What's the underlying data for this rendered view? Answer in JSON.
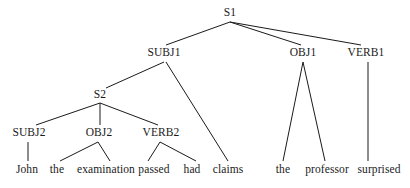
{
  "figure": {
    "type": "syntax-tree-diagram",
    "background_color": "#ffffff",
    "text_color": "#1a1a1a",
    "edge_color": "#1a1a1a",
    "width": 410,
    "height": 188,
    "sentence": "John the examination passed had claims the professor surprised"
  },
  "nodes": [
    {
      "id": "S1",
      "label": "S1",
      "x": 230,
      "y": 13,
      "level": 0
    },
    {
      "id": "SUBJ1",
      "label": "SUBJ1",
      "x": 164,
      "y": 53,
      "level": 1
    },
    {
      "id": "OBJ1",
      "label": "OBJ1",
      "x": 303,
      "y": 53,
      "level": 1
    },
    {
      "id": "VERB1",
      "label": "VERB1",
      "x": 366,
      "y": 53,
      "level": 1
    },
    {
      "id": "S2",
      "label": "S2",
      "x": 100,
      "y": 95,
      "level": 2
    },
    {
      "id": "SUBJ2",
      "label": "SUBJ2",
      "x": 29,
      "y": 133,
      "level": 3
    },
    {
      "id": "OBJ2",
      "label": "OBJ2",
      "x": 99,
      "y": 133,
      "level": 3
    },
    {
      "id": "VERB2",
      "label": "VERB2",
      "x": 161,
      "y": 133,
      "level": 3
    }
  ],
  "leaves": [
    {
      "id": "w1",
      "label": "John",
      "x": 27,
      "y": 170
    },
    {
      "id": "w2",
      "label": "the",
      "x": 57,
      "y": 170
    },
    {
      "id": "w3",
      "label": "examination",
      "x": 106,
      "y": 170
    },
    {
      "id": "w4",
      "label": "passed",
      "x": 154,
      "y": 170
    },
    {
      "id": "w5",
      "label": "had",
      "x": 192,
      "y": 170
    },
    {
      "id": "w6",
      "label": "claims",
      "x": 228,
      "y": 170
    },
    {
      "id": "w7",
      "label": "the",
      "x": 283,
      "y": 170
    },
    {
      "id": "w8",
      "label": "professor",
      "x": 327,
      "y": 170
    },
    {
      "id": "w9",
      "label": "surprised",
      "x": 379,
      "y": 170
    }
  ],
  "edges": [
    {
      "from": "S1",
      "to": "SUBJ1",
      "x1": 230,
      "y1": 22,
      "x2": 166,
      "y2": 45
    },
    {
      "from": "S1",
      "to": "OBJ1",
      "x1": 230,
      "y1": 22,
      "x2": 301,
      "y2": 45
    },
    {
      "from": "S1",
      "to": "VERB1",
      "x1": 230,
      "y1": 22,
      "x2": 361,
      "y2": 45
    },
    {
      "from": "SUBJ1",
      "to": "S2",
      "x1": 164,
      "y1": 62,
      "x2": 106,
      "y2": 88
    },
    {
      "from": "SUBJ1",
      "to": "w6",
      "x1": 166,
      "y1": 62,
      "x2": 228,
      "y2": 161
    },
    {
      "from": "S2",
      "to": "SUBJ2",
      "x1": 100,
      "y1": 103,
      "x2": 36,
      "y2": 125
    },
    {
      "from": "S2",
      "to": "OBJ2",
      "x1": 100,
      "y1": 103,
      "x2": 100,
      "y2": 125
    },
    {
      "from": "S2",
      "to": "VERB2",
      "x1": 100,
      "y1": 103,
      "x2": 158,
      "y2": 125
    },
    {
      "from": "SUBJ2",
      "to": "w1",
      "x1": 28,
      "y1": 142,
      "x2": 28,
      "y2": 161
    },
    {
      "from": "OBJ2",
      "to": "w2",
      "x1": 98,
      "y1": 142,
      "x2": 60,
      "y2": 161
    },
    {
      "from": "OBJ2",
      "to": "w3",
      "x1": 98,
      "y1": 142,
      "x2": 110,
      "y2": 161
    },
    {
      "from": "VERB2",
      "to": "w4",
      "x1": 160,
      "y1": 142,
      "x2": 148,
      "y2": 161
    },
    {
      "from": "VERB2",
      "to": "w5",
      "x1": 160,
      "y1": 142,
      "x2": 196,
      "y2": 161
    },
    {
      "from": "OBJ1",
      "to": "w7",
      "x1": 303,
      "y1": 62,
      "x2": 283,
      "y2": 161
    },
    {
      "from": "OBJ1",
      "to": "w8",
      "x1": 303,
      "y1": 62,
      "x2": 325,
      "y2": 161
    },
    {
      "from": "VERB1",
      "to": "w9",
      "x1": 368,
      "y1": 62,
      "x2": 368,
      "y2": 161
    }
  ]
}
